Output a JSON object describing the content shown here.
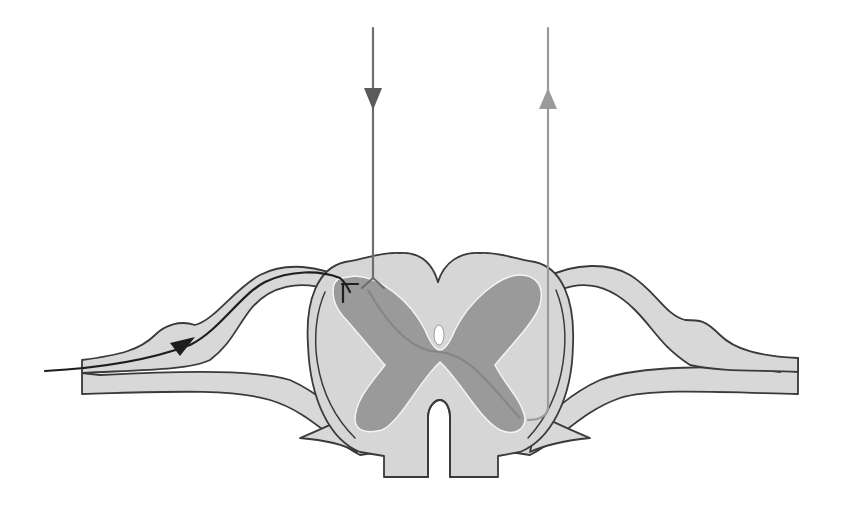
{
  "diagram": {
    "labels": [],
    "colors": {
      "background": "#ffffff",
      "white_matter": "#d6d6d6",
      "grey_matter": "#9a9a9a",
      "outline": "#3a3a3a",
      "sensory_afferent": "#1e1e1e",
      "descending_tract": "#6e6e6e",
      "ascending_tract": "#9a9a9a"
    },
    "elements": [
      {
        "name": "spinal-cord",
        "description": "cross-section of spinal cord"
      },
      {
        "name": "grey-matter",
        "description": "butterfly-shaped grey matter"
      },
      {
        "name": "central-canal",
        "description": "central canal"
      },
      {
        "name": "left-spinal-nerve",
        "description": "left dorsal and ventral roots with dorsal root ganglion"
      },
      {
        "name": "right-spinal-nerve",
        "description": "right dorsal and ventral roots with dorsal root ganglion"
      },
      {
        "name": "afferent-fiber",
        "description": "black sensory fiber entering from left, arrow pointing toward cord"
      },
      {
        "name": "descending-tract",
        "description": "dark grey vertical line with downward arrow"
      },
      {
        "name": "ascending-tract",
        "description": "light grey vertical line with upward arrow"
      }
    ]
  }
}
